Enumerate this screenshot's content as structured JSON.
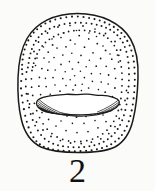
{
  "figure": {
    "caption_number": "2",
    "background_color": "#fbfbfa",
    "ink_color": "#1a1a18",
    "illustration_type": "stippled line drawing"
  },
  "specimen": {
    "outline": {
      "name": "seed-body-outline",
      "shape": "rounded sub-globose",
      "center_x": 77,
      "center_y": 82,
      "width_px": 120,
      "height_px": 138,
      "left_px": 18,
      "top_px": 13,
      "right_px": 138,
      "bottom_px": 151
    },
    "hilum": {
      "name": "hilum-scar",
      "shape": "elongate lenticular band",
      "center_x": 78,
      "center_y": 104,
      "width_px": 82,
      "height_px": 20,
      "left_px": 37,
      "right_px": 119,
      "hatching": "radiating strokes converging inward from both ends"
    },
    "shading": {
      "technique": "stipple",
      "density": "dense at margins, sparse at centre",
      "dot_count": 430,
      "dot_size_px": 1.4
    }
  },
  "labels": {
    "plate_number": "2"
  }
}
